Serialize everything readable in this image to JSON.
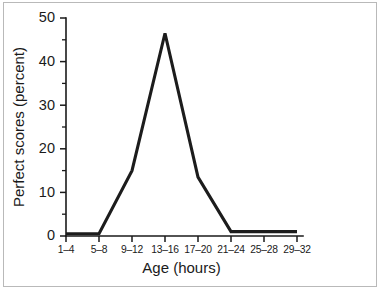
{
  "chart_data": {
    "type": "line",
    "title": "",
    "subtitle": "",
    "xlabel": "Age (hours)",
    "ylabel": "Perfect scores (percent)",
    "categories": [
      "1–4",
      "5–8",
      "9–12",
      "13–16",
      "17–20",
      "21–24",
      "25–28",
      "29–32"
    ],
    "values": [
      0.5,
      0.5,
      15,
      46.5,
      13.5,
      1,
      1,
      1
    ],
    "series": [
      {
        "name": "Perfect scores",
        "values": [
          0.5,
          0.5,
          15,
          46.5,
          13.5,
          1,
          1,
          1
        ]
      }
    ],
    "ylim": [
      0,
      50
    ],
    "ytick_labels": [
      "0",
      "10",
      "20",
      "30",
      "40",
      "50"
    ],
    "ytick_values": [
      0,
      10,
      20,
      30,
      40,
      50
    ],
    "yminor_values": [
      5,
      15,
      25,
      35,
      45
    ],
    "grid": false,
    "legend": false,
    "legend_position": "none",
    "line_color": "#1c1c1c",
    "axis_color": "#1a1a1a",
    "background_color": "#ffffff"
  },
  "figure": {
    "frame_color": "#b9b9b9"
  }
}
